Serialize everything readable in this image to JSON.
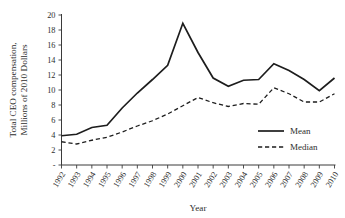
{
  "chart_data": {
    "type": "line",
    "title": "",
    "xlabel": "Year",
    "ylabel": "Total CEO compensation, Millions of 2010 Dollars",
    "ylabel_line1": "Total CEO compensation,",
    "ylabel_line2": "Millions of 2010 Dollars",
    "categories": [
      "1992",
      "1993",
      "1994",
      "1995",
      "1996",
      "1997",
      "1998",
      "1999",
      "2000",
      "2001",
      "2002",
      "2003",
      "2004",
      "2005",
      "2006",
      "2007",
      "2008",
      "2009",
      "2010"
    ],
    "x": [
      1992,
      1993,
      1994,
      1995,
      1996,
      1997,
      1998,
      1999,
      2000,
      2001,
      2002,
      2003,
      2004,
      2005,
      2006,
      2007,
      2008,
      2009,
      2010
    ],
    "series": [
      {
        "name": "Mean",
        "style": "solid",
        "values": [
          3.9,
          4.1,
          5.0,
          5.3,
          7.6,
          9.6,
          11.4,
          13.3,
          18.9,
          15.0,
          11.6,
          10.5,
          11.3,
          11.4,
          13.5,
          12.6,
          11.4,
          9.9,
          11.6
        ]
      },
      {
        "name": "Median",
        "style": "dashed",
        "values": [
          3.1,
          2.8,
          3.3,
          3.7,
          4.4,
          5.2,
          5.9,
          6.8,
          7.9,
          9.0,
          8.3,
          7.8,
          8.2,
          8.1,
          10.3,
          9.5,
          8.4,
          8.4,
          9.5
        ]
      }
    ],
    "ylim": [
      0,
      20
    ],
    "yticks": [
      0,
      2,
      4,
      6,
      8,
      10,
      12,
      14,
      16,
      18,
      20
    ],
    "ytick_labels": [
      "-",
      "2",
      "4",
      "6",
      "8",
      "10",
      "12",
      "14",
      "16",
      "18",
      "20"
    ],
    "xlim": [
      1992,
      2010
    ],
    "grid": false,
    "legend_position": "middle-right",
    "legend_entries": [
      "Mean",
      "Median"
    ],
    "axis_color": "#3b3b3b",
    "line_color": "#1d1d1d"
  }
}
